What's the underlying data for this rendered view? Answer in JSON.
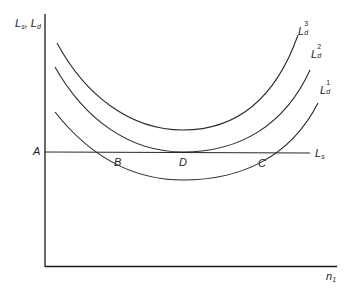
{
  "diagram": {
    "y_axis_label": {
      "main1": "L",
      "sub1": "s",
      "sep": ",",
      "main2": "L",
      "sub2": "d"
    },
    "x_axis_label": {
      "main": "n",
      "sub": "1"
    },
    "supply_line_label": {
      "main": "L",
      "sub": "s"
    },
    "curves": [
      {
        "name": "L_d^3",
        "main": "L",
        "sub": "d",
        "sup": "3"
      },
      {
        "name": "L_d^2",
        "main": "L",
        "sub": "d",
        "sup": "2"
      },
      {
        "name": "L_d^1",
        "main": "L",
        "sub": "d",
        "sup": "1"
      }
    ],
    "points": {
      "A": "A",
      "B": "B",
      "C": "C",
      "D": "D"
    },
    "line_color": "#2a2a2a",
    "axis_color": "#1a1a1a"
  }
}
